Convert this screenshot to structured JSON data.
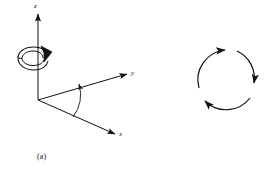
{
  "figure": {
    "background_color": "#ffffff",
    "ink_color": "#111111",
    "width": 279,
    "height": 177
  },
  "panel_a": {
    "caption": "(a)",
    "labels": {
      "z_axis": "z",
      "y_axis": "y",
      "x_axis": "x"
    },
    "icons": {
      "z_axis_arrow": "arrow-up-icon",
      "y_axis_arrow": "arrow-right-icon",
      "x_axis_arrow": "arrow-down-right-icon",
      "rotation_arrow": "curved-rotation-arrow-icon",
      "angle_arc_arrow": "angle-arc-arrow-icon"
    }
  },
  "panel_b": {
    "caption": "(b)",
    "labels": {
      "top": "x",
      "right": "y",
      "left": "z"
    },
    "icons": {
      "arc_z_to_x": "curved-arrow-icon",
      "arc_x_to_y": "curved-arrow-icon",
      "arc_y_to_z": "curved-arrow-icon"
    }
  }
}
